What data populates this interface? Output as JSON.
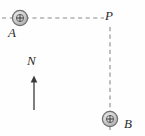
{
  "figure": {
    "background_color": "#fefefe",
    "line_color": "#808080",
    "label_color": "#2b2b2b",
    "conductor_fill_color": "#c9c9c9",
    "conductor_stroke_color": "#6e6e6e",
    "arrow_color": "#3a3a3a"
  },
  "labels": {
    "conductor_a": "A",
    "conductor_b": "B",
    "point_p": "P",
    "north": "N"
  },
  "elements": {
    "conductor_a": {
      "name": "conductor-a",
      "symbol": "current-out-of-page",
      "center_x": 20,
      "center_y": 18,
      "radius": 8
    },
    "conductor_b": {
      "name": "conductor-b",
      "symbol": "current-out-of-page",
      "center_x": 110,
      "center_y": 119,
      "radius": 8
    },
    "point_p": {
      "name": "point-p",
      "x": 110,
      "y": 18
    },
    "dashed_line_horizontal": {
      "name": "dashed-line-a-to-p",
      "x1": 2,
      "y1": 18,
      "x2": 104,
      "y2": 18,
      "style": "dashed"
    },
    "dashed_line_vertical": {
      "name": "dashed-line-p-to-b",
      "x1": 110,
      "y1": 27,
      "x2": 110,
      "y2": 132,
      "style": "dashed"
    },
    "north_arrow": {
      "name": "north-arrow",
      "x": 34,
      "y_tail": 110,
      "y_head": 76,
      "direction": "up"
    }
  }
}
